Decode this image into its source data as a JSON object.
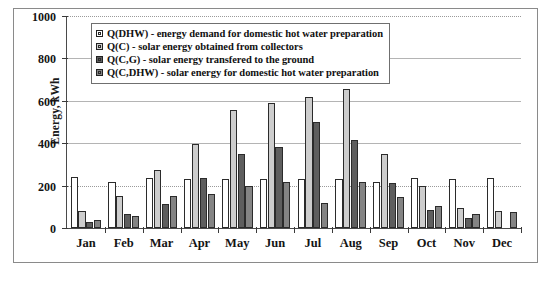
{
  "chart_data": {
    "type": "bar",
    "title": "",
    "xlabel": "",
    "ylabel": "Energy, kWh",
    "ylim": [
      0,
      1000
    ],
    "yticks": [
      0,
      200,
      400,
      600,
      800,
      1000
    ],
    "grid": true,
    "legend_position": "top-left-inside",
    "categories": [
      "Jan",
      "Feb",
      "Mar",
      "Apr",
      "May",
      "Jun",
      "Jul",
      "Aug",
      "Sep",
      "Oct",
      "Nov",
      "Dec"
    ],
    "series": [
      {
        "name": "Q(DHW) - energy demand for domestic hot water preparation",
        "key": "Q(DHW)",
        "color": "#ffffff",
        "values": [
          240,
          215,
          235,
          230,
          230,
          230,
          230,
          230,
          215,
          235,
          230,
          235
        ]
      },
      {
        "name": "Q(C) - solar energy obtained from collectors",
        "key": "Q(C)",
        "color": "#cdcdcd",
        "values": [
          80,
          150,
          275,
          395,
          555,
          590,
          620,
          655,
          350,
          200,
          95,
          80
        ]
      },
      {
        "name": "Q(C,G) - solar energy transfered to the ground",
        "key": "Q(C,G)",
        "color": "#5e5e5e",
        "values": [
          30,
          65,
          115,
          235,
          350,
          380,
          500,
          415,
          210,
          85,
          45,
          0
        ]
      },
      {
        "name": "Q(C,DHW) - solar energy for domestic hot water preparation",
        "key": "Q(C,DHW)",
        "color": "#848484",
        "values": [
          40,
          55,
          150,
          160,
          200,
          215,
          120,
          215,
          145,
          105,
          65,
          75
        ]
      }
    ]
  },
  "legend": {
    "items": [
      {
        "label": "Q(DHW) - energy demand for domestic hot water preparation"
      },
      {
        "label": "Q(C) - solar energy obtained from collectors"
      },
      {
        "label": "Q(C,G) - solar energy transfered to the ground"
      },
      {
        "label": "Q(C,DHW) - solar energy for domestic hot water preparation"
      }
    ]
  }
}
